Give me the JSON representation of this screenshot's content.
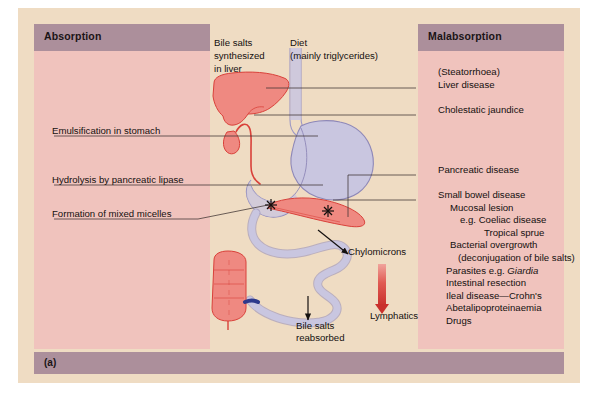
{
  "figure": {
    "label": "(a)",
    "caption_marker": "(a)"
  },
  "panels": {
    "left": {
      "title": "Absorption",
      "items": [
        "Emulsification in stomach",
        "Hydrolysis by pancreatic lipase",
        "Formation of mixed micelles"
      ]
    },
    "right": {
      "title": "Malabsorption",
      "items": [
        "(Steatorrhoea)\nLiver disease",
        "Cholestatic jaundice",
        "Pancreatic disease",
        "Small bowel disease"
      ],
      "small_bowel_causes": [
        "Mucosal lesion",
        "e.g. Coeliac disease",
        "Tropical sprue",
        "Bacterial overgrowth",
        "(deconjugation of bile salts)",
        "Parasites e.g. Giardia",
        "Intestinal resection",
        "Ileal disease—Crohn's",
        "Abetalipoproteinaemia",
        "Drugs"
      ],
      "italic_term": "Giardia"
    }
  },
  "diagram": {
    "labels": {
      "bile_salts_synthesized": "Bile salts\nsynthesized\nin liver",
      "diet": "Diet\n(mainly triglycerides)",
      "chylomicrons": "Chylomicrons",
      "lymphatics": "Lymphatics",
      "bile_salts_reabsorbed": "Bile salts\nreabsorbed"
    },
    "organs": [
      "liver",
      "gallbladder",
      "bile-duct",
      "oesophagus",
      "stomach",
      "duodenum",
      "pancreas",
      "small-intestine",
      "colon"
    ]
  },
  "colors": {
    "background": "#efdcc3",
    "panel_fill": "#f0c3bd",
    "panel_header": "#ac8f9b",
    "organ_red": "#ef8981",
    "organ_lavender": "#c9c6e0",
    "duct_red": "#d9413a",
    "text": "#14100f",
    "leader_line": "#3c3230",
    "lymphatic_arrow": "#e05a52"
  }
}
